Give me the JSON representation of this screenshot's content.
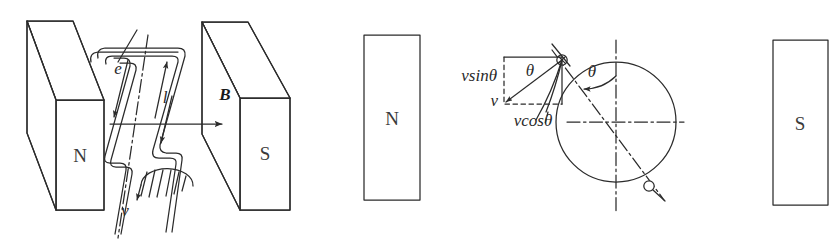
{
  "figure": {
    "background_color": "#ffffff",
    "stroke_color": "#2b2b2b"
  },
  "panel_left": {
    "name": "rotating-coil-between-magnet-poles",
    "magnet_north_label": "N",
    "magnet_south_label": "S",
    "field_label": "B",
    "coil_label": "e",
    "length_label": "l",
    "velocity_label": "v"
  },
  "panel_right": {
    "name": "velocity-decomposition-circle",
    "magnet_north_label": "N",
    "magnet_south_label": "S",
    "vsin_label": "vsinθ",
    "vcos_label": "vcosθ",
    "v_label": "v",
    "theta_label_left": "θ",
    "theta_label_right": "θ"
  }
}
